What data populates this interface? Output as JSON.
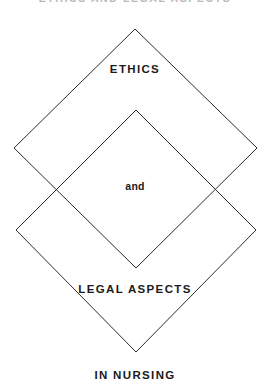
{
  "page": {
    "background_color": "#ffffff",
    "width": 270,
    "height": 388,
    "clipped_header_text": "ETHICS AND LEGAL ASPECTS"
  },
  "diagram": {
    "type": "two-overlapping-diamonds",
    "stroke_color": "#2b2b2b",
    "fill": "none",
    "stroke_width": 1,
    "shapes": [
      {
        "name": "upper-diamond",
        "label": "ETHICS",
        "top": [
          135,
          29
        ],
        "right": [
          257,
          148
        ],
        "bottom": [
          136,
          268
        ],
        "left": [
          14,
          148
        ]
      },
      {
        "name": "lower-diamond",
        "label": "LEGAL ASPECTS",
        "top": [
          136,
          110
        ],
        "right": [
          256,
          230
        ],
        "bottom": [
          136,
          352
        ],
        "left": [
          16,
          230
        ]
      }
    ],
    "intersections": [
      [
        58,
        190
      ],
      [
        214,
        190
      ]
    ]
  },
  "labels": {
    "ethics": "ETHICS",
    "and": "and",
    "legal_aspects": "LEGAL ASPECTS",
    "in_nursing": "IN NURSING"
  }
}
